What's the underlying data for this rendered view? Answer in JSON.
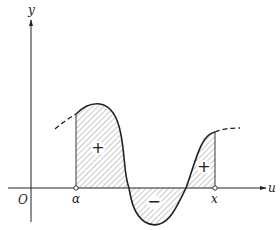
{
  "diagram": {
    "type": "area-under-curve",
    "axes": {
      "x_label": "u",
      "y_label": "y",
      "origin_label": "O"
    },
    "points": {
      "lower_limit_label": "α",
      "upper_limit_label": "x"
    },
    "regions": [
      {
        "sign": "+",
        "description": "positive area between α and first zero"
      },
      {
        "sign": "−",
        "description": "negative area below axis"
      },
      {
        "sign": "+",
        "description": "positive area up to x"
      }
    ],
    "colors": {
      "stroke": "#222222",
      "hatch": "#666666",
      "background": "#ffffff"
    }
  }
}
